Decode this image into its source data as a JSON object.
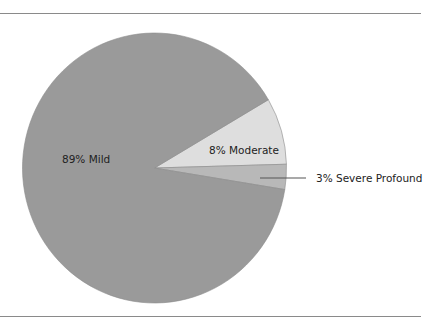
{
  "chart_data": {
    "type": "pie",
    "title": "",
    "categories": [
      "Mild",
      "Moderate",
      "Severe Profound"
    ],
    "values": [
      89,
      8,
      3
    ],
    "unit": "%",
    "labels": [
      "89% Mild",
      "8% Moderate",
      "3% Severe Profound"
    ],
    "colors": [
      "#9a9a9a",
      "#dedede",
      "#b8b8b8"
    ],
    "legend": "none (inline labels; Severe Profound uses leader line)"
  },
  "labels": {
    "mild": "89% Mild",
    "moderate": "8% Moderate",
    "severe": "3% Severe Profound"
  }
}
